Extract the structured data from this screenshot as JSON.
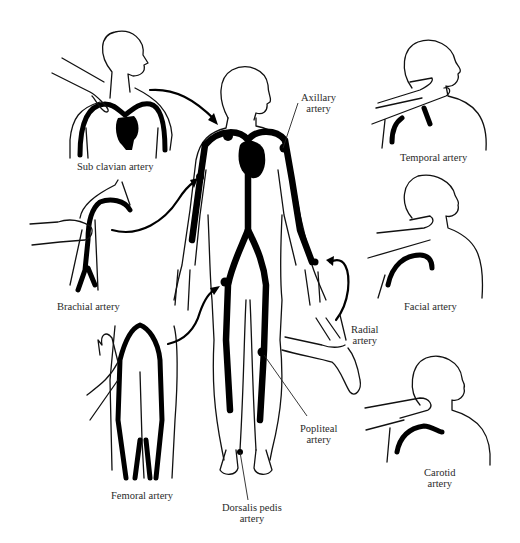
{
  "diagram": {
    "background": "#ffffff",
    "ink_color": "#000000",
    "labels": {
      "subclavian": "Sub clavian artery",
      "axillary_1": "Axillary",
      "axillary_2": "artery",
      "temporal": "Temporal artery",
      "facial": "Facial artery",
      "brachial": "Brachial artery",
      "radial_1": "Radial",
      "radial_2": "artery",
      "popliteal_1": "Popliteal",
      "popliteal_2": "artery",
      "carotid_1": "Carotid",
      "carotid_2": "artery",
      "femoral": "Femoral artery",
      "dorsalis_1": "Dorsalis pedis",
      "dorsalis_2": "artery"
    },
    "panels": [
      {
        "name": "subclavian-panel",
        "label": "Sub clavian artery"
      },
      {
        "name": "central-body",
        "label": "Axillary artery"
      },
      {
        "name": "temporal-panel",
        "label": "Temporal artery"
      },
      {
        "name": "facial-panel",
        "label": "Facial artery"
      },
      {
        "name": "brachial-panel",
        "label": "Brachial artery"
      },
      {
        "name": "radial-panel",
        "label": "Radial artery"
      },
      {
        "name": "popliteal-pointer",
        "label": "Popliteal artery"
      },
      {
        "name": "carotid-panel",
        "label": "Carotid artery"
      },
      {
        "name": "femoral-panel",
        "label": "Femoral artery"
      },
      {
        "name": "dorsalis-pointer",
        "label": "Dorsalis pedis artery"
      }
    ]
  }
}
